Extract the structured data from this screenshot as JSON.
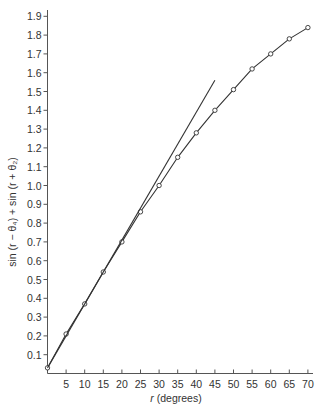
{
  "chart_data": {
    "type": "line",
    "title": "",
    "xlabel": "r (degrees)",
    "xlabel_var": "r",
    "xlabel_unit": " (degrees)",
    "ylabel": "sin (r − θ₄) + sin (r + θ₂)",
    "xlim": [
      0,
      72
    ],
    "ylim": [
      0,
      1.97
    ],
    "grid": false,
    "legend": null,
    "x_ticks": [
      5,
      10,
      15,
      20,
      25,
      30,
      35,
      40,
      45,
      50,
      55,
      60,
      65,
      70
    ],
    "y_ticks": [
      0.1,
      0.2,
      0.3,
      0.4,
      0.5,
      0.6,
      0.7,
      0.8,
      0.9,
      1.0,
      1.1,
      1.2,
      1.3,
      1.4,
      1.5,
      1.6,
      1.7,
      1.8,
      1.9
    ],
    "y_tick_labels": [
      "0.1",
      "0.2",
      "0.3",
      "0.4",
      "0.5",
      "0.6",
      "0.7",
      "0.8",
      "0.9",
      "1.0",
      "1.1",
      "1.2",
      "1.3",
      "1.4",
      "1.5",
      "1.6",
      "1.7",
      "1.8",
      "1.9"
    ],
    "series": [
      {
        "name": "sin (r − θ₄) + sin (r + θ₂)",
        "style": "line-with-open-circle-markers",
        "x": [
          0,
          5,
          10,
          15,
          20,
          25,
          30,
          35,
          40,
          45,
          50,
          55,
          60,
          65,
          70
        ],
        "values": [
          0.03,
          0.21,
          0.37,
          0.54,
          0.7,
          0.86,
          1.0,
          1.15,
          1.28,
          1.4,
          1.51,
          1.62,
          1.7,
          1.78,
          1.84
        ]
      },
      {
        "name": "tangent line",
        "style": "straight-line",
        "x": [
          0,
          45
        ],
        "values": [
          0.03,
          1.56
        ]
      }
    ],
    "colors": {
      "line": "#333333",
      "axis": "#555555",
      "background": "#ffffff"
    }
  }
}
